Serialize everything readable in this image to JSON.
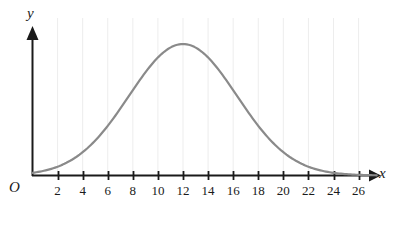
{
  "figure": {
    "background_color": "#ffffff",
    "width": 398,
    "height": 226
  },
  "axes": {
    "x_axis_label": "x",
    "y_axis_label": "y",
    "origin_label": "O",
    "axis_color": "#1a1a1a",
    "x_axis_has_arrow": true,
    "y_axis_has_arrow": true
  },
  "chart_data": {
    "type": "line",
    "title": "",
    "subtitle": "",
    "xlabel": "x",
    "ylabel": "y",
    "grid": true,
    "grid_orientation": "vertical",
    "grid_color": "#ededed",
    "legend": false,
    "legend_position": "none",
    "xlim": [
      0,
      27.5
    ],
    "ylim": [
      0,
      1.12
    ],
    "xticks": [
      2,
      4,
      6,
      8,
      10,
      12,
      14,
      16,
      18,
      20,
      22,
      24,
      26
    ],
    "xtick_labels": [
      "2",
      "4",
      "6",
      "8",
      "10",
      "12",
      "14",
      "16",
      "18",
      "20",
      "22",
      "24",
      "26"
    ],
    "yticks": [],
    "ytick_labels": [],
    "series": [
      {
        "name": "bell-curve",
        "color": "#8a8a8a",
        "line_width": 2.2,
        "shape": "gaussian",
        "peak_x": 12,
        "peak_y": 1.0,
        "sigma": 4.3,
        "x": [
          0,
          1,
          2,
          3,
          4,
          5,
          6,
          7,
          8,
          9,
          10,
          11,
          12,
          13,
          14,
          15,
          16,
          17,
          18,
          19,
          20,
          21,
          22,
          23,
          24,
          25,
          26,
          27
        ],
        "values": [
          0.013,
          0.024,
          0.043,
          0.072,
          0.114,
          0.172,
          0.246,
          0.335,
          0.435,
          0.539,
          0.638,
          0.724,
          0.787,
          0.824,
          0.831,
          0.809,
          0.761,
          0.692,
          0.61,
          0.521,
          0.433,
          0.349,
          0.274,
          0.209,
          0.154,
          0.11,
          0.077,
          0.052
        ]
      }
    ],
    "annotations": []
  },
  "ticks": [
    {
      "value": "2"
    },
    {
      "value": "4"
    },
    {
      "value": "6"
    },
    {
      "value": "8"
    },
    {
      "value": "10"
    },
    {
      "value": "12"
    },
    {
      "value": "14"
    },
    {
      "value": "16"
    },
    {
      "value": "18"
    },
    {
      "value": "20"
    },
    {
      "value": "22"
    },
    {
      "value": "24"
    },
    {
      "value": "26"
    }
  ]
}
